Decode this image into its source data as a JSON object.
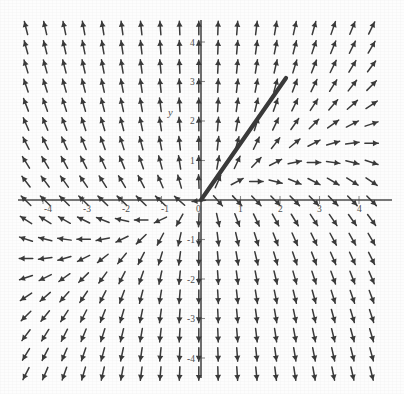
{
  "figure": {
    "kind": "direction-field",
    "axis_color": "#4a4a4a",
    "arrow_color": "#3a3a3a",
    "background": "#fdfdfd",
    "y_axis_name": "y",
    "x_axis_name": ""
  },
  "chart_data": {
    "type": "scatter",
    "title": "",
    "subtitle": "",
    "xlabel": "",
    "ylabel": "y",
    "xlim": [
      -4.6,
      4.6
    ],
    "ylim": [
      -4.6,
      4.6
    ],
    "grid": false,
    "legend": null,
    "plot_kind": "vector-field / slope-field (phase portrait)",
    "field_definition": {
      "dx": "x",
      "dy": "3*y - x",
      "note": "arrow direction u = x, v = 3y - x, normalized to unit length"
    },
    "axes": {
      "origin_px": [
        201,
        200
      ],
      "pixels_per_unit_x": 39.5,
      "pixels_per_unit_y": 39.5,
      "x_ticks": [
        -4,
        -3,
        -2,
        -1,
        0,
        1,
        2,
        3,
        4
      ],
      "x_tick_labels": [
        "-4",
        "-3",
        "-2",
        "-1",
        "0",
        "1",
        "2",
        "3",
        "4"
      ],
      "y_ticks": [
        -4,
        -3,
        -2,
        -1,
        1,
        2,
        3,
        4
      ],
      "y_tick_labels": [
        "-4",
        "-3",
        "-2",
        "-1",
        "1",
        "2",
        "3",
        "4"
      ]
    },
    "grid_layout": {
      "x_start_px": 26,
      "y_start_px": 28,
      "spacing_px": 19.2,
      "cols": 19,
      "rows": 19,
      "arrow_length_px": 13.5
    },
    "annotations": [
      {
        "name": "separatrix-trajectory",
        "type": "line",
        "x": [
          0.0,
          2.15
        ],
        "y": [
          0.0,
          3.1
        ],
        "x_px": [
          201,
          286
        ],
        "y_px": [
          200,
          78
        ],
        "stroke_width_px": 4.2,
        "description": "thick straight solution curve from origin into the first quadrant"
      }
    ]
  },
  "labels": {
    "x_ticks": [
      {
        "text": "-4",
        "x_px": 44,
        "y_px": 212
      },
      {
        "text": "-3",
        "x_px": 83,
        "y_px": 212
      },
      {
        "text": "-2",
        "x_px": 122,
        "y_px": 212
      },
      {
        "text": "-1",
        "x_px": 161,
        "y_px": 212
      },
      {
        "text": "0",
        "x_px": 196,
        "y_px": 212
      },
      {
        "text": "1",
        "x_px": 238,
        "y_px": 212
      },
      {
        "text": "2",
        "x_px": 278,
        "y_px": 212
      },
      {
        "text": "3",
        "x_px": 317,
        "y_px": 212
      },
      {
        "text": "4",
        "x_px": 357,
        "y_px": 212
      }
    ],
    "y_ticks": [
      {
        "text": "4",
        "x_px": 190,
        "y_px": 46
      },
      {
        "text": "3",
        "x_px": 190,
        "y_px": 85
      },
      {
        "text": "2",
        "x_px": 190,
        "y_px": 124
      },
      {
        "text": "1",
        "x_px": 190,
        "y_px": 164
      },
      {
        "text": "-1",
        "x_px": 187,
        "y_px": 243
      },
      {
        "text": "-2",
        "x_px": 187,
        "y_px": 283
      },
      {
        "text": "-3",
        "x_px": 187,
        "y_px": 322
      },
      {
        "text": "-4",
        "x_px": 187,
        "y_px": 362
      }
    ],
    "axis_name": {
      "text": "y",
      "x_px": 168,
      "y_px": 116
    }
  }
}
